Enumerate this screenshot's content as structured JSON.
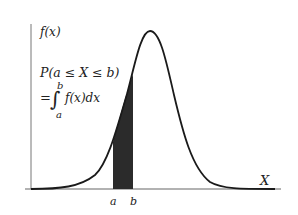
{
  "diagram": {
    "y_axis_label": "f(x)",
    "x_axis_label": "X",
    "probability_line1": "P(a ≤ X ≤ b)",
    "integral_eq": "=",
    "integral_sign": "∫",
    "integral_upper": "b",
    "integral_lower": "a",
    "integrand": "f(x)dx",
    "tick_a": "a",
    "tick_b": "b",
    "colors": {
      "curve": "#1a1a1a",
      "axis": "#555555",
      "shade": "#2b2b2b",
      "text": "#222222"
    }
  }
}
